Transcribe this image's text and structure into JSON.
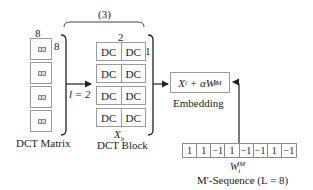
{
  "dct_matrix": {
    "top_label": "8",
    "side_label": "8",
    "caption": "DCT Matrix",
    "block_count": 4,
    "block_icon": "dc-coefficient-icon"
  },
  "group": {
    "brace_label": "(3)",
    "arrow_label": "l = 2"
  },
  "dct_block": {
    "top_label": "2",
    "side_label": "1",
    "variable": "X",
    "variable_sub": "b",
    "caption": "DCT Block",
    "rows": [
      [
        "DC",
        "DC"
      ],
      [
        "DC",
        "DC"
      ],
      [
        "DC",
        "DC"
      ],
      [
        "DC",
        "DC"
      ]
    ]
  },
  "embedding": {
    "formula_x": "X",
    "formula_x_sub": "i",
    "formula_op": " + αW",
    "formula_w_sub": "i",
    "formula_w_sup": "fM",
    "caption": "Embedding"
  },
  "sequence": {
    "values": [
      "1",
      "1",
      "−1",
      "1",
      "−1",
      "−1",
      "1",
      "−1"
    ],
    "variable": "W",
    "variable_sub": "i",
    "variable_sup": "fM",
    "caption": "M'-Sequence (L = 8)"
  }
}
